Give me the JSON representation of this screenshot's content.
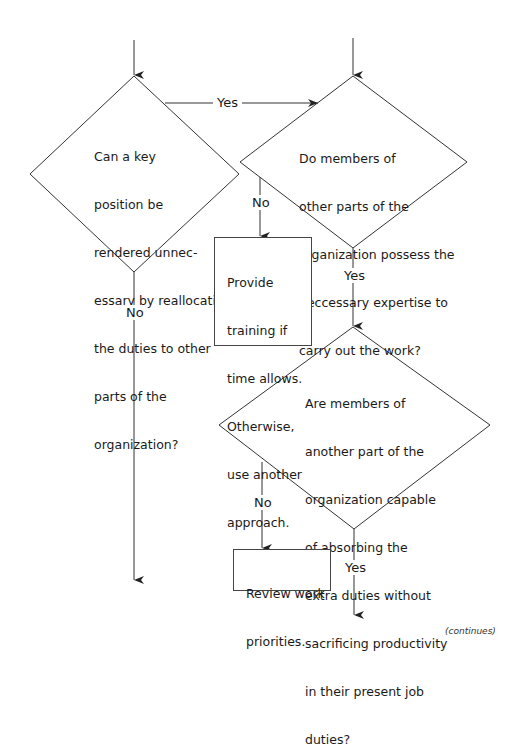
{
  "decisions": [
    {
      "id": "d1",
      "lines": [
        "Can a key",
        "position be",
        "rendered unnec-",
        "essary by reallocating",
        "the duties to other",
        "parts of the",
        "organization?"
      ]
    },
    {
      "id": "d2",
      "lines": [
        "Do members of",
        "other parts of the",
        "organization possess the",
        "neccessary expertise to",
        "carry out the work?"
      ]
    },
    {
      "id": "d3",
      "lines": [
        "Are members of",
        "another part of the",
        "organization capable",
        "of absorbing the",
        "extra duties without",
        "sacrificing productivity",
        "in their present job",
        "duties?"
      ]
    }
  ],
  "actions": [
    {
      "id": "a1",
      "lines": [
        "Provide",
        "training if",
        "time allows.",
        "Otherwise,",
        "use another",
        "approach."
      ]
    },
    {
      "id": "a2",
      "lines": [
        "Review work",
        "priorities."
      ]
    }
  ],
  "labels": {
    "d1_yes": "Yes",
    "d1_no": "No",
    "d2_no": "No",
    "d2_yes": "Yes",
    "d3_no": "No",
    "d3_yes": "Yes"
  },
  "footer": {
    "continues": "(continues)"
  }
}
